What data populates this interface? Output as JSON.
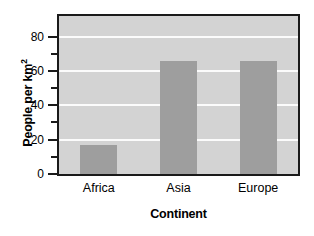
{
  "chart_data": {
    "type": "bar",
    "title": "",
    "categories": [
      "Africa",
      "Asia",
      "Europe"
    ],
    "values": [
      17,
      66,
      66
    ],
    "xlabel": "Continent",
    "ylabel": "People per km",
    "ylabel_superscript": "2",
    "ylim": [
      0,
      92
    ],
    "ytick_major": [
      0,
      20,
      40,
      60,
      80
    ],
    "ytick_minor": [
      10,
      30,
      50,
      70
    ],
    "ytick_labels": [
      "0",
      "20",
      "40",
      "60",
      "80"
    ],
    "grid": true,
    "gridlines_at": [
      20,
      40,
      60,
      80
    ],
    "legend": "none",
    "colors": {
      "bar_fill": "#9e9e9e",
      "plot_background": "#d3d3d3",
      "gridline": "#fbfbfb",
      "axis": "#1a1a1a",
      "text": "#000000",
      "page_background": "#ffffff"
    }
  }
}
